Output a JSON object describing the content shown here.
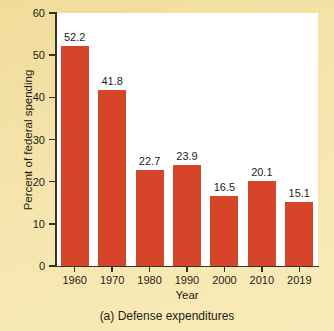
{
  "chart_data": {
    "type": "bar",
    "title": "",
    "caption": "(a) Defense expenditures",
    "xlabel": "Year",
    "ylabel": "Percent of federal spending",
    "categories": [
      "1960",
      "1970",
      "1980",
      "1990",
      "2000",
      "2010",
      "2019"
    ],
    "values": [
      52.2,
      41.8,
      22.7,
      23.9,
      16.5,
      20.1,
      15.1
    ],
    "value_labels": [
      "52.2",
      "41.8",
      "22.7",
      "23.9",
      "16.5",
      "20.1",
      "15.1"
    ],
    "ylim": [
      0,
      60
    ],
    "yticks": [
      0,
      10,
      20,
      30,
      40,
      50,
      60
    ],
    "ytick_labels": [
      "0",
      "10",
      "20",
      "30",
      "40",
      "50",
      "60"
    ],
    "grid": false,
    "legend": null,
    "bar_color": "#d6442a",
    "plot_background": "#ffffff",
    "figure_background": "#f4e3a6",
    "axis_color": "#3a3025",
    "text_color": "#241d14"
  }
}
